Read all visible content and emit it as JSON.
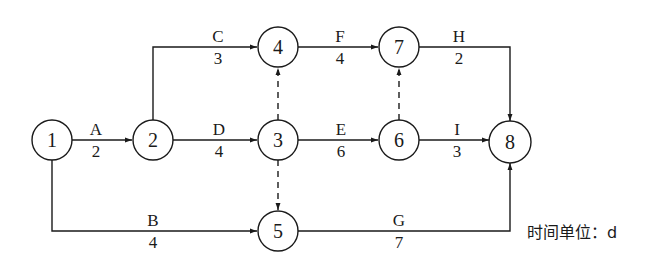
{
  "diagram": {
    "type": "activity-on-arrow network",
    "nodes": [
      {
        "id": "1",
        "label": "1",
        "cx": 52,
        "cy": 140
      },
      {
        "id": "2",
        "label": "2",
        "cx": 153,
        "cy": 140
      },
      {
        "id": "3",
        "label": "3",
        "cx": 278,
        "cy": 140
      },
      {
        "id": "4",
        "label": "4",
        "cx": 278,
        "cy": 47
      },
      {
        "id": "5",
        "label": "5",
        "cx": 278,
        "cy": 231
      },
      {
        "id": "6",
        "label": "6",
        "cx": 399,
        "cy": 140
      },
      {
        "id": "7",
        "label": "7",
        "cx": 399,
        "cy": 47
      },
      {
        "id": "8",
        "label": "8",
        "cx": 510,
        "cy": 142
      }
    ],
    "activities": [
      {
        "name": "A",
        "duration": "2",
        "from": "1",
        "to": "2"
      },
      {
        "name": "B",
        "duration": "4",
        "from": "1",
        "to": "5"
      },
      {
        "name": "C",
        "duration": "3",
        "from": "2",
        "to": "4"
      },
      {
        "name": "D",
        "duration": "4",
        "from": "2",
        "to": "3"
      },
      {
        "name": "E",
        "duration": "6",
        "from": "3",
        "to": "6"
      },
      {
        "name": "F",
        "duration": "4",
        "from": "4",
        "to": "7"
      },
      {
        "name": "G",
        "duration": "7",
        "from": "5",
        "to": "8"
      },
      {
        "name": "H",
        "duration": "2",
        "from": "7",
        "to": "8"
      },
      {
        "name": "I",
        "duration": "3",
        "from": "6",
        "to": "8"
      }
    ],
    "dummies": [
      {
        "from": "3",
        "to": "4"
      },
      {
        "from": "3",
        "to": "5"
      },
      {
        "from": "6",
        "to": "7"
      }
    ],
    "unit_note": "时间单位：d"
  }
}
